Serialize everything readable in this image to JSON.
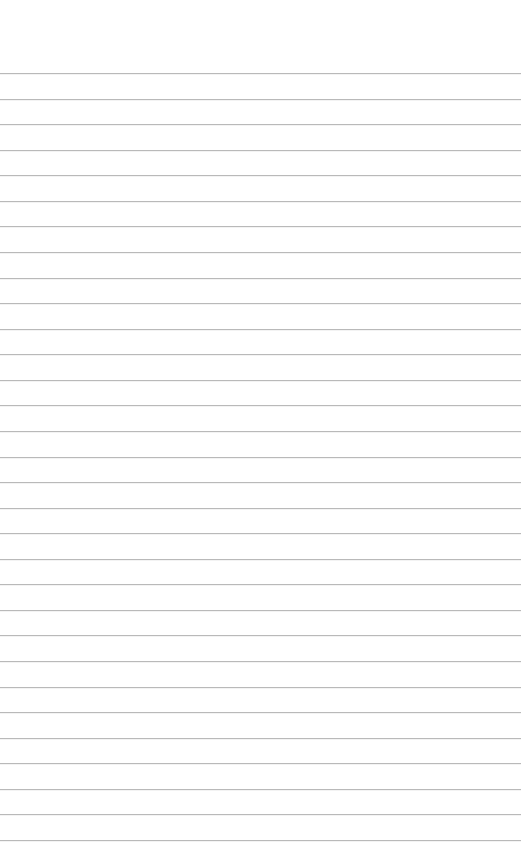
{
  "page": {
    "type": "lined-paper",
    "background_color": "#ffffff",
    "rule_color": "#b9b9b9",
    "rule_count": 31,
    "first_rule_y": 73,
    "last_rule_y": 840,
    "rule_left_x": 0,
    "rule_right_x": 521
  },
  "lines": [
    {
      "text": ""
    },
    {
      "text": ""
    },
    {
      "text": ""
    },
    {
      "text": ""
    },
    {
      "text": ""
    },
    {
      "text": ""
    },
    {
      "text": ""
    },
    {
      "text": ""
    },
    {
      "text": ""
    },
    {
      "text": ""
    },
    {
      "text": ""
    },
    {
      "text": ""
    },
    {
      "text": ""
    },
    {
      "text": ""
    },
    {
      "text": ""
    },
    {
      "text": ""
    },
    {
      "text": ""
    },
    {
      "text": ""
    },
    {
      "text": ""
    },
    {
      "text": ""
    },
    {
      "text": ""
    },
    {
      "text": ""
    },
    {
      "text": ""
    },
    {
      "text": ""
    },
    {
      "text": ""
    },
    {
      "text": ""
    },
    {
      "text": ""
    },
    {
      "text": ""
    },
    {
      "text": ""
    },
    {
      "text": ""
    },
    {
      "text": ""
    }
  ]
}
